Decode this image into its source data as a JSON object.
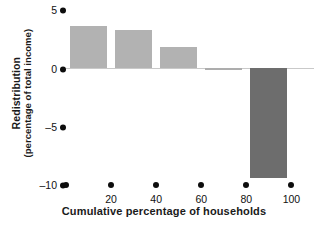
{
  "chart_data": {
    "type": "bar",
    "title": "",
    "xlabel": "Cumulative percentage of households",
    "ylabel_line1": "Redistribution",
    "ylabel_line2": "(percentage of total income)",
    "categories": [
      "20",
      "40",
      "60",
      "80",
      "100"
    ],
    "values": [
      3.6,
      3.3,
      1.8,
      -0.1,
      -9.4
    ],
    "value_labels": [
      "3.6",
      "3.3",
      "1.8",
      "-0.1",
      "-9.4"
    ],
    "yticks": [
      5,
      0,
      -5,
      -10
    ],
    "ytick_labels": [
      "5",
      "0",
      "–5",
      "–10"
    ],
    "xticks": [
      20,
      40,
      60,
      80,
      100
    ],
    "xtick_labels": [
      "20",
      "40",
      "60",
      "80",
      "100"
    ],
    "ylim": [
      -10,
      5
    ],
    "xlim": [
      0,
      110
    ],
    "grid": false,
    "legend": "none",
    "colors": {
      "positive_bar": "#b2b2b2",
      "negative_bar": "#6d6d6d",
      "axis_marker": "#0d0d0d",
      "zero_line": "#c9c9c9",
      "text": "#111111",
      "background": "#ffffff"
    }
  }
}
